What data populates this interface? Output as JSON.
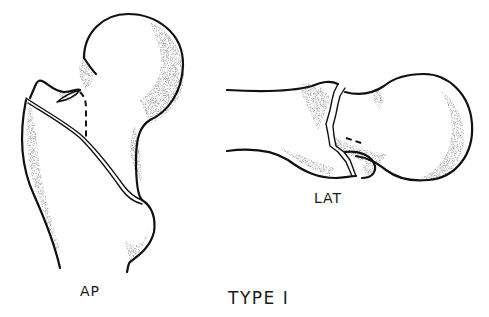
{
  "figure": {
    "title": "TYPE I",
    "views": [
      {
        "id": "ap",
        "label": "AP"
      },
      {
        "id": "lat",
        "label": "LAT"
      }
    ]
  },
  "colors": {
    "ink": "#111111",
    "background": "#ffffff",
    "stipple": "#555555"
  }
}
